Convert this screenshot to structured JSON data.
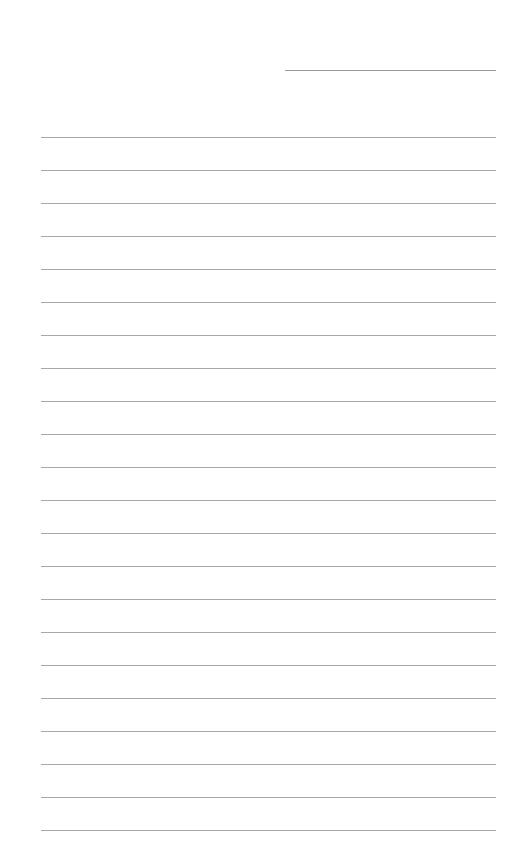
{
  "page": {
    "type": "lined-paper",
    "background_color": "#ffffff",
    "line_color": "#a8a8a8",
    "header_line": {
      "x": 285,
      "y": 70,
      "width": 211
    },
    "ruled_lines": {
      "count": 22,
      "first_y": 137,
      "spacing": 33,
      "x": 41,
      "width": 455
    }
  }
}
